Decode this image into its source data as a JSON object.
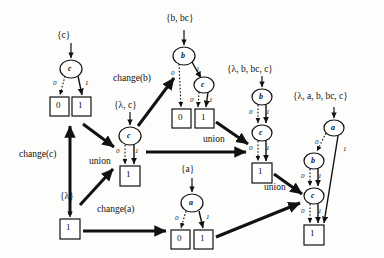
{
  "figure": {
    "type": "bdd-construction-diagram",
    "background": "#fdfdfb",
    "ink": "#111111"
  },
  "set_labels": [
    {
      "id": "set-c",
      "text": "{c}",
      "x": 57,
      "y": 31
    },
    {
      "id": "set-b-bc",
      "text": "{b, bc}",
      "x": 166,
      "y": 14
    },
    {
      "id": "set-lambda-c",
      "text": "{λ, c}",
      "x": 114,
      "y": 101
    },
    {
      "id": "set-lbbcc",
      "text": "{λ, b, bc, c}",
      "x": 227,
      "y": 65
    },
    {
      "id": "set-labbcc",
      "text": "{λ, a, b, bc, c}",
      "x": 293,
      "y": 92
    },
    {
      "id": "set-a",
      "text": "{a}",
      "x": 181,
      "y": 165
    },
    {
      "id": "set-lambda",
      "text": "{λ}",
      "x": 60,
      "y": 192
    }
  ],
  "operation_labels": [
    {
      "id": "op-change-c",
      "text": "change(c)",
      "x": 19,
      "y": 150
    },
    {
      "id": "op-change-b",
      "text": "change(b)",
      "x": 113,
      "y": 74
    },
    {
      "id": "op-change-a",
      "text": "change(a)",
      "x": 97,
      "y": 205
    },
    {
      "id": "op-union-1",
      "text": "union",
      "x": 89,
      "y": 157
    },
    {
      "id": "op-union-2",
      "text": "union",
      "x": 203,
      "y": 135
    },
    {
      "id": "op-union-3",
      "text": "union",
      "x": 264,
      "y": 183
    }
  ],
  "bdds": [
    {
      "id": "bdd-c",
      "set": "{c}",
      "nodes": [
        {
          "label": "c",
          "x": 71,
          "y": 69
        }
      ],
      "terminals": [
        {
          "value": "0",
          "x": 59,
          "y": 106
        },
        {
          "value": "1",
          "x": 82,
          "y": 106
        }
      ],
      "edges": [
        {
          "from": "c",
          "bit": "0",
          "style": "dotted",
          "to": "terminal-0"
        },
        {
          "from": "c",
          "bit": "1",
          "style": "solid",
          "to": "terminal-1"
        }
      ]
    },
    {
      "id": "bdd-b-bc",
      "set": "{b, bc}",
      "nodes": [
        {
          "label": "b",
          "x": 184,
          "y": 56
        },
        {
          "label": "c",
          "x": 204,
          "y": 85
        }
      ],
      "terminals": [
        {
          "value": "0",
          "x": 181,
          "y": 118
        },
        {
          "value": "1",
          "x": 205,
          "y": 118
        }
      ],
      "edges": [
        {
          "from": "b",
          "bit": "0",
          "style": "dotted",
          "to": "terminal-0"
        },
        {
          "from": "b",
          "bit": "1",
          "style": "solid",
          "to": "c"
        },
        {
          "from": "c",
          "bit": "0",
          "style": "dotted",
          "to": "terminal-1"
        },
        {
          "from": "c",
          "bit": "1",
          "style": "solid",
          "to": "terminal-1"
        }
      ]
    },
    {
      "id": "bdd-lambda-c",
      "set": "{λ, c}",
      "nodes": [
        {
          "label": "c",
          "x": 130,
          "y": 136
        }
      ],
      "terminals": [
        {
          "value": "1",
          "x": 130,
          "y": 175
        }
      ],
      "edges": [
        {
          "from": "c",
          "bit": "0",
          "style": "dotted",
          "to": "terminal-1"
        },
        {
          "from": "c",
          "bit": "1",
          "style": "solid",
          "to": "terminal-1"
        }
      ]
    },
    {
      "id": "bdd-lbbcc",
      "set": "{λ, b, bc, c}",
      "nodes": [
        {
          "label": "b",
          "x": 262,
          "y": 97
        },
        {
          "label": "c",
          "x": 262,
          "y": 133
        }
      ],
      "terminals": [
        {
          "value": "1",
          "x": 262,
          "y": 172
        }
      ],
      "edges": [
        {
          "from": "b",
          "bit": "0",
          "style": "dotted",
          "to": "c"
        },
        {
          "from": "b",
          "bit": "1",
          "style": "solid",
          "to": "c"
        },
        {
          "from": "c",
          "bit": "0",
          "style": "dotted",
          "to": "terminal-1"
        },
        {
          "from": "c",
          "bit": "1",
          "style": "solid",
          "to": "terminal-1"
        }
      ]
    },
    {
      "id": "bdd-labbcc",
      "set": "{λ, a, b, bc, c}",
      "nodes": [
        {
          "label": "a",
          "x": 334,
          "y": 128
        },
        {
          "label": "b",
          "x": 314,
          "y": 161
        },
        {
          "label": "c",
          "x": 314,
          "y": 196
        }
      ],
      "terminals": [
        {
          "value": "1",
          "x": 314,
          "y": 234
        }
      ],
      "edges": [
        {
          "from": "a",
          "bit": "0",
          "style": "dotted",
          "to": "b"
        },
        {
          "from": "a",
          "bit": "1",
          "style": "solid",
          "to": "terminal-1"
        },
        {
          "from": "b",
          "bit": "0",
          "style": "dotted",
          "to": "c"
        },
        {
          "from": "b",
          "bit": "1",
          "style": "solid",
          "to": "c"
        },
        {
          "from": "c",
          "bit": "0",
          "style": "dotted",
          "to": "terminal-1"
        },
        {
          "from": "c",
          "bit": "1",
          "style": "solid",
          "to": "terminal-1"
        }
      ]
    },
    {
      "id": "bdd-a",
      "set": "{a}",
      "nodes": [
        {
          "label": "a",
          "x": 192,
          "y": 203
        }
      ],
      "terminals": [
        {
          "value": "0",
          "x": 180,
          "y": 239
        },
        {
          "value": "1",
          "x": 203,
          "y": 239
        }
      ],
      "edges": [
        {
          "from": "a",
          "bit": "0",
          "style": "dotted",
          "to": "terminal-0"
        },
        {
          "from": "a",
          "bit": "1",
          "style": "solid",
          "to": "terminal-1"
        }
      ]
    },
    {
      "id": "bdd-lambda",
      "set": "{λ}",
      "nodes": [],
      "terminals": [
        {
          "value": "1",
          "x": 70,
          "y": 228
        }
      ],
      "edges": []
    }
  ],
  "node_glyphs": [
    {
      "id": "node-c-1",
      "label": "c",
      "cx": 71,
      "cy": 69,
      "rx": 11,
      "ry": 9
    },
    {
      "id": "node-b-1",
      "label": "b",
      "cx": 184,
      "cy": 56,
      "rx": 11,
      "ry": 9
    },
    {
      "id": "node-c-2",
      "label": "c",
      "cx": 204,
      "cy": 85,
      "rx": 10,
      "ry": 8
    },
    {
      "id": "node-c-3",
      "label": "c",
      "cx": 130,
      "cy": 136,
      "rx": 11,
      "ry": 9
    },
    {
      "id": "node-b-2",
      "label": "b",
      "cx": 262,
      "cy": 97,
      "rx": 10,
      "ry": 8
    },
    {
      "id": "node-c-4",
      "label": "c",
      "cx": 262,
      "cy": 133,
      "rx": 10,
      "ry": 8
    },
    {
      "id": "node-a-1",
      "label": "a",
      "cx": 334,
      "cy": 128,
      "rx": 10,
      "ry": 8
    },
    {
      "id": "node-b-3",
      "label": "b",
      "cx": 314,
      "cy": 161,
      "rx": 10,
      "ry": 8
    },
    {
      "id": "node-c-5",
      "label": "c",
      "cx": 314,
      "cy": 196,
      "rx": 10,
      "ry": 8
    },
    {
      "id": "node-a-2",
      "label": "a",
      "cx": 192,
      "cy": 203,
      "rx": 11,
      "ry": 9
    }
  ],
  "terminal_glyphs": [
    {
      "id": "term-c-0",
      "value": "0",
      "x": 50,
      "y": 97,
      "w": 19,
      "h": 19
    },
    {
      "id": "term-c-1",
      "value": "1",
      "x": 72,
      "y": 97,
      "w": 19,
      "h": 19
    },
    {
      "id": "term-bbc-0",
      "value": "0",
      "x": 172,
      "y": 109,
      "w": 19,
      "h": 19
    },
    {
      "id": "term-bbc-1",
      "value": "1",
      "x": 195,
      "y": 109,
      "w": 19,
      "h": 19
    },
    {
      "id": "term-lc-1",
      "value": "1",
      "x": 120,
      "y": 166,
      "w": 20,
      "h": 20
    },
    {
      "id": "term-lbbcc-1",
      "value": "1",
      "x": 252,
      "y": 163,
      "w": 20,
      "h": 20
    },
    {
      "id": "term-labbcc-1",
      "value": "1",
      "x": 304,
      "y": 225,
      "w": 20,
      "h": 20
    },
    {
      "id": "term-a-0",
      "value": "0",
      "x": 171,
      "y": 230,
      "w": 19,
      "h": 19
    },
    {
      "id": "term-a-1",
      "value": "1",
      "x": 194,
      "y": 230,
      "w": 19,
      "h": 19
    },
    {
      "id": "term-lambda-1",
      "value": "1",
      "x": 60,
      "y": 219,
      "w": 20,
      "h": 20
    }
  ],
  "bit_labels": [
    {
      "id": "bit-c1-0",
      "text": "0",
      "x": 53,
      "y": 80
    },
    {
      "id": "bit-c1-1",
      "text": "1",
      "x": 85,
      "y": 80
    },
    {
      "id": "bit-b1-0",
      "text": "0",
      "x": 171,
      "y": 70
    },
    {
      "id": "bit-b1-1",
      "text": "1",
      "x": 196,
      "y": 66
    },
    {
      "id": "bit-c2-0",
      "text": "0",
      "x": 190,
      "y": 97
    },
    {
      "id": "bit-c2-1",
      "text": "1",
      "x": 209,
      "y": 97
    },
    {
      "id": "bit-c3-0",
      "text": "0",
      "x": 116,
      "y": 148
    },
    {
      "id": "bit-c3-1",
      "text": "1",
      "x": 135,
      "y": 148
    },
    {
      "id": "bit-b2-0",
      "text": "0",
      "x": 249,
      "y": 109
    },
    {
      "id": "bit-b2-1",
      "text": "1",
      "x": 266,
      "y": 109
    },
    {
      "id": "bit-c4-0",
      "text": "0",
      "x": 249,
      "y": 145
    },
    {
      "id": "bit-c4-1",
      "text": "1",
      "x": 266,
      "y": 145
    },
    {
      "id": "bit-a1-0",
      "text": "0",
      "x": 315,
      "y": 139
    },
    {
      "id": "bit-a1-1",
      "text": "1",
      "x": 343,
      "y": 146
    },
    {
      "id": "bit-b3-0",
      "text": "0",
      "x": 301,
      "y": 173
    },
    {
      "id": "bit-b3-1",
      "text": "1",
      "x": 318,
      "y": 173
    },
    {
      "id": "bit-c5-0",
      "text": "0",
      "x": 301,
      "y": 208
    },
    {
      "id": "bit-c5-1",
      "text": "1",
      "x": 318,
      "y": 208
    },
    {
      "id": "bit-a2-0",
      "text": "0",
      "x": 175,
      "y": 215
    },
    {
      "id": "bit-a2-1",
      "text": "1",
      "x": 206,
      "y": 214
    }
  ]
}
